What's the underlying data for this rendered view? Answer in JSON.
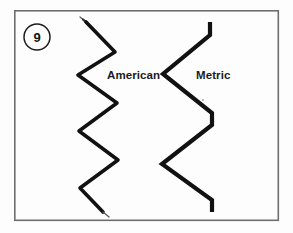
{
  "figure": {
    "badge_number": "9",
    "background_color": "#fdfdfd",
    "frame_color": "#6e6e6e",
    "ink_color": "#111111",
    "labels": {
      "left": "American",
      "right": "Metric"
    }
  },
  "diagram_data": {
    "type": "line-illustration",
    "title": "American",
    "subtitle": "Metric",
    "description_items": [
      "American",
      "Metric"
    ],
    "frame": {
      "x": 14,
      "y": 10,
      "width": 265,
      "height": 211
    },
    "badge": {
      "cx": 37,
      "cy": 37,
      "r": 13,
      "text": "9"
    },
    "shapes": [
      {
        "name": "american-zigzag",
        "label": "American",
        "corner_style": "rounded",
        "stroke_width": 3.6,
        "label_position": {
          "x": 107,
          "y": 79
        },
        "points": [
          [
            86,
            22
          ],
          [
            115,
            52
          ],
          [
            78,
            75
          ],
          [
            117,
            103
          ],
          [
            79,
            131
          ],
          [
            118,
            160
          ],
          [
            80,
            188
          ],
          [
            103,
            212
          ]
        ]
      },
      {
        "name": "metric-zigzag",
        "label": "Metric",
        "corner_style": "sharp",
        "stroke_width": 4.2,
        "label_position": {
          "x": 196,
          "y": 79
        },
        "points": [
          [
            210,
            22
          ],
          [
            210,
            35
          ],
          [
            163,
            74
          ],
          [
            212,
            113
          ],
          [
            212,
            125
          ],
          [
            162,
            164
          ],
          [
            212,
            200
          ],
          [
            212,
            212
          ]
        ]
      }
    ]
  }
}
